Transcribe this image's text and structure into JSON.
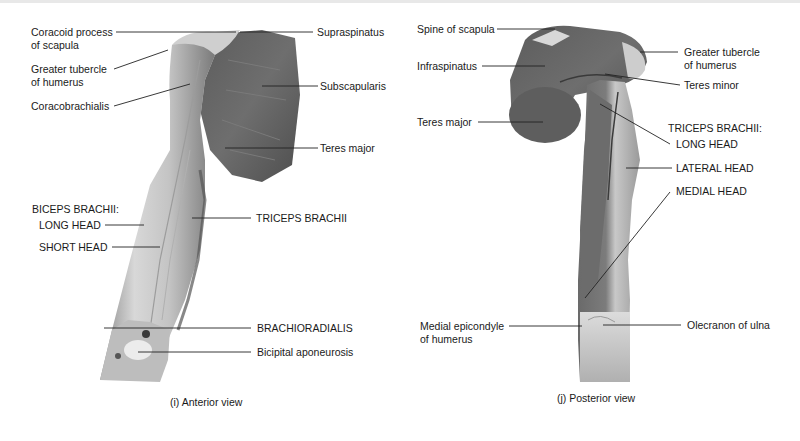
{
  "anterior": {
    "caption": "(i) Anterior view",
    "labels": {
      "coracoid_1": "Coracoid process",
      "coracoid_2": "of scapula",
      "greater_tubercle_1": "Greater tubercle",
      "greater_tubercle_2": "of humerus",
      "coracobrachialis": "Coracobrachialis",
      "supraspinatus": "Supraspinatus",
      "subscapularis": "Subscapularis",
      "teres_major": "Teres major",
      "biceps_group": "BICEPS BRACHII:",
      "long_head": "LONG HEAD",
      "short_head": "SHORT HEAD",
      "triceps_brachii": "TRICEPS BRACHII",
      "brachioradialis": "BRACHIORADIALIS",
      "bicipital_aponeurosis": "Bicipital aponeurosis"
    }
  },
  "posterior": {
    "caption": "(j) Posterior view",
    "labels": {
      "spine_of_scapula": "Spine of scapula",
      "infraspinatus": "Infraspinatus",
      "teres_major": "Teres major",
      "greater_tubercle_1": "Greater tubercle",
      "greater_tubercle_2": "of humerus",
      "teres_minor": "Teres minor",
      "triceps_group": "TRICEPS BRACHII:",
      "long_head": "LONG HEAD",
      "lateral_head": "LATERAL HEAD",
      "medial_head": "MEDIAL HEAD",
      "medial_epicondyle_1": "Medial epicondyle",
      "medial_epicondyle_2": "of humerus",
      "olecranon": "Olecranon of ulna"
    }
  },
  "colors": {
    "muscle_dark": "#5a5a5a",
    "muscle_mid": "#8c8c8c",
    "muscle_light": "#d4d4d4",
    "tendon": "#eeeeee",
    "leader_line": "#222222"
  }
}
